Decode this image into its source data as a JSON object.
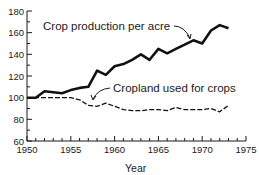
{
  "chart_data": {
    "type": "line",
    "title": "",
    "xlabel": "Year",
    "ylabel": "",
    "xlim": [
      1950,
      1975
    ],
    "ylim": [
      60,
      180
    ],
    "x_ticks": [
      1950,
      1955,
      1960,
      1965,
      1970,
      1975
    ],
    "y_ticks": [
      60,
      80,
      100,
      120,
      140,
      160,
      180
    ],
    "grid": false,
    "legend_position": "inline annotations with arrows",
    "x": [
      1950,
      1951,
      1952,
      1953,
      1954,
      1955,
      1956,
      1957,
      1958,
      1959,
      1960,
      1961,
      1962,
      1963,
      1964,
      1965,
      1966,
      1967,
      1968,
      1969,
      1970,
      1971,
      1972,
      1973
    ],
    "series": [
      {
        "name": "Crop production per acre",
        "style": "solid-thick",
        "values": [
          100,
          100,
          106,
          105,
          104,
          107,
          109,
          110,
          125,
          121,
          129,
          131,
          135,
          140,
          135,
          145,
          141,
          145,
          149,
          153,
          150,
          162,
          167,
          164
        ]
      },
      {
        "name": "Cropland used for crops",
        "style": "dashed",
        "values": [
          100,
          100,
          100,
          100,
          100,
          100,
          98,
          93,
          92,
          95,
          92,
          89,
          88,
          88,
          89,
          89,
          88,
          91,
          89,
          89,
          89,
          90,
          87,
          93
        ]
      }
    ],
    "annotations": [
      {
        "text": "Crop production per acre",
        "points_to": "series 0 near 1969"
      },
      {
        "text": "Cropland used for crops",
        "points_to": "series 1 near 1957"
      }
    ]
  },
  "labels": {
    "xlabel": "Year",
    "series0": "Crop production per acre",
    "series1": "Cropland used for crops"
  }
}
